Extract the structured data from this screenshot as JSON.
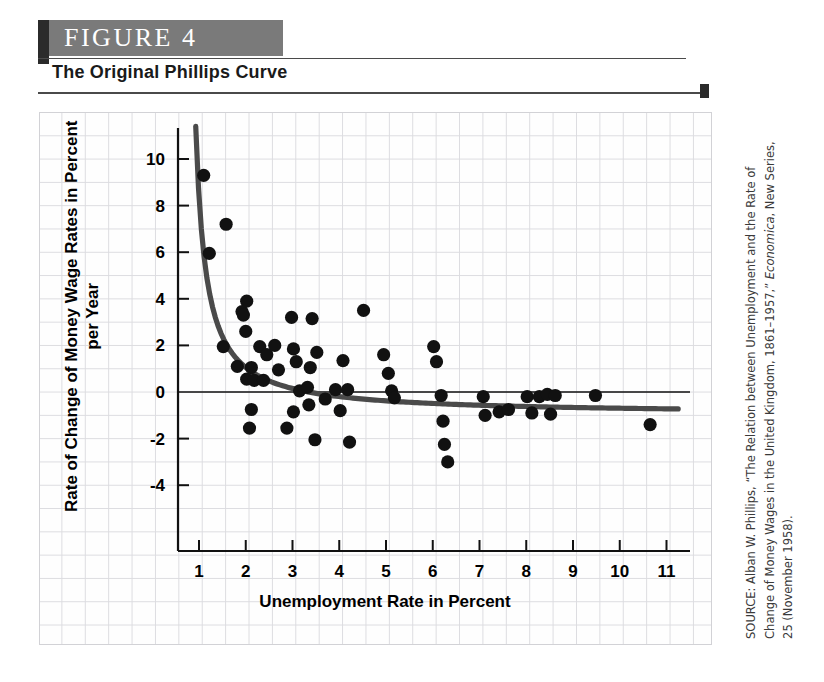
{
  "figure": {
    "banner_label": "FIGURE  4",
    "caption": "The Original Phillips Curve",
    "banner_color": "#7a7a7a",
    "tab_color": "#2b2b2b"
  },
  "source": {
    "prefix": "SOURCE: Alban W. Phillips, “The Relation between Unemployment and the Rate of Change of Money Wages in the United Kingdom, 1861–1957,” ",
    "italic": "Economica",
    "suffix": ", New Series, 25 (November 1958)."
  },
  "chart_data": {
    "type": "scatter",
    "title": "The Original Phillips Curve",
    "xlabel": "Unemployment Rate in Percent",
    "ylabel": "Rate of Change of Money Wage Rates in Percent per Year",
    "xlim": [
      0.3,
      11.6
    ],
    "ylim": [
      -5.4,
      11.6
    ],
    "xticks": [
      1,
      2,
      3,
      4,
      5,
      6,
      7,
      8,
      9,
      10,
      11
    ],
    "yticks": [
      -4,
      -2,
      0,
      2,
      4,
      6,
      8,
      10
    ],
    "grid": true,
    "legend": "none",
    "zero_line": true,
    "point_color": "#111111",
    "curve_color": "#4a4a4a",
    "points": [
      [
        1.1,
        9.3
      ],
      [
        1.22,
        5.95
      ],
      [
        1.58,
        7.2
      ],
      [
        1.52,
        1.95
      ],
      [
        1.92,
        3.45
      ],
      [
        1.95,
        3.3
      ],
      [
        2.02,
        3.9
      ],
      [
        2.0,
        2.6
      ],
      [
        1.82,
        1.1
      ],
      [
        2.12,
        1.05
      ],
      [
        2.02,
        0.55
      ],
      [
        2.18,
        0.5
      ],
      [
        2.12,
        -0.75
      ],
      [
        2.3,
        1.95
      ],
      [
        2.38,
        0.5
      ],
      [
        2.45,
        1.6
      ],
      [
        2.08,
        -1.55
      ],
      [
        2.62,
        2.0
      ],
      [
        2.7,
        0.95
      ],
      [
        2.98,
        3.2
      ],
      [
        3.02,
        1.85
      ],
      [
        3.08,
        1.3
      ],
      [
        3.15,
        0.05
      ],
      [
        2.88,
        -1.55
      ],
      [
        3.02,
        -0.85
      ],
      [
        3.42,
        3.15
      ],
      [
        3.38,
        1.05
      ],
      [
        3.32,
        0.2
      ],
      [
        3.35,
        -0.55
      ],
      [
        3.52,
        1.7
      ],
      [
        3.7,
        -0.3
      ],
      [
        3.48,
        -2.05
      ],
      [
        3.92,
        0.1
      ],
      [
        4.08,
        1.35
      ],
      [
        4.18,
        0.1
      ],
      [
        4.02,
        -0.8
      ],
      [
        4.22,
        -2.15
      ],
      [
        4.52,
        3.5
      ],
      [
        4.95,
        1.6
      ],
      [
        5.05,
        0.8
      ],
      [
        5.12,
        0.05
      ],
      [
        5.18,
        -0.25
      ],
      [
        6.02,
        1.95
      ],
      [
        6.08,
        1.3
      ],
      [
        6.18,
        -0.15
      ],
      [
        6.22,
        -1.25
      ],
      [
        6.25,
        -2.25
      ],
      [
        6.32,
        -3.0
      ],
      [
        7.08,
        -0.2
      ],
      [
        7.12,
        -1.0
      ],
      [
        7.42,
        -0.85
      ],
      [
        7.62,
        -0.75
      ],
      [
        8.02,
        -0.2
      ],
      [
        8.28,
        -0.2
      ],
      [
        8.12,
        -0.9
      ],
      [
        8.45,
        -0.1
      ],
      [
        8.62,
        -0.15
      ],
      [
        8.52,
        -0.95
      ],
      [
        9.48,
        -0.15
      ],
      [
        10.65,
        -1.4
      ]
    ],
    "curve": {
      "description": "fitted Phillips curve: hyperbolic decline flattening toward -1",
      "x_start": 0.93,
      "x_end": 11.25,
      "y_start": 11.4,
      "y_asymptote": -0.95
    }
  }
}
